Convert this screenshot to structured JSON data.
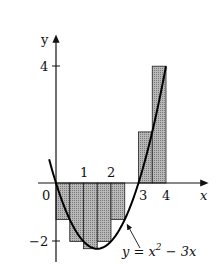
{
  "chart_data": {
    "type": "bar",
    "title": "",
    "xlabel": "x",
    "ylabel": "y",
    "function_label": "y = x² − 3x",
    "function": "x^2 - 3x",
    "xlim": [
      0,
      4
    ],
    "ylim": [
      -2.25,
      4
    ],
    "x_ticks": [
      "0",
      "1",
      "2",
      "3",
      "4"
    ],
    "y_ticks": [
      "4",
      "−2"
    ],
    "delta_x": 0.5,
    "categories": [
      "0–0.5",
      "0.5–1",
      "1–1.5",
      "1.5–2",
      "2–2.5",
      "2.5–3",
      "3–3.5",
      "3.5–4"
    ],
    "x_left": [
      0,
      0.5,
      1,
      1.5,
      2,
      2.5,
      3,
      3.5
    ],
    "values": [
      -1.25,
      -2,
      -2.25,
      -2,
      -1.25,
      0,
      1.75,
      4
    ],
    "grid": false,
    "legend": "none"
  },
  "labels": {
    "x_axis": "x",
    "y_axis": "y",
    "origin": "0",
    "tick_1": "1",
    "tick_2": "2",
    "tick_3": "3",
    "tick_4": "4",
    "y_tick_4": "4",
    "y_tick_neg2": "−2",
    "curve_prefix": "y = x",
    "curve_exp": "2",
    "curve_suffix": " − 3x"
  },
  "colors": {
    "bar_fill": "#a9a9a9",
    "axis": "#111111",
    "curve": "#000000"
  }
}
